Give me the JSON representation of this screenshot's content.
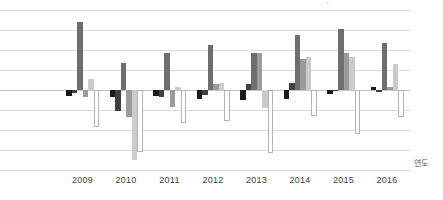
{
  "chart_data": {
    "type": "bar",
    "title": "",
    "xlabel": "연도",
    "ylabel": "",
    "categories": [
      "2009",
      "2010",
      "2011",
      "2012",
      "2013",
      "2014",
      "2015",
      "2016"
    ],
    "series": [
      {
        "name": "series-1-black",
        "color": "#1a1a1a",
        "outlined": false,
        "values": [
          -0.3,
          -0.35,
          -0.3,
          -0.45,
          -0.5,
          -0.45,
          -0.2,
          0.15
        ]
      },
      {
        "name": "series-2-darkest-gray",
        "color": "#3f3f3f",
        "outlined": false,
        "values": [
          -0.15,
          -1.05,
          -0.35,
          -0.25,
          0.3,
          0.35,
          -0.05,
          -0.1
        ]
      },
      {
        "name": "series-3-dark-gray",
        "color": "#6e6e6e",
        "outlined": false,
        "values": [
          3.4,
          1.35,
          1.85,
          2.25,
          1.85,
          2.75,
          3.05,
          2.35
        ]
      },
      {
        "name": "series-4-medium-gray",
        "color": "#9b9b9b",
        "outlined": false,
        "values": [
          -0.35,
          -1.35,
          -0.85,
          0.3,
          1.85,
          1.55,
          1.85,
          0.15
        ]
      },
      {
        "name": "series-5-light-gray",
        "color": "#cbcbcb",
        "outlined": false,
        "values": [
          0.55,
          -3.5,
          0.15,
          0.35,
          -0.9,
          1.65,
          1.65,
          1.3
        ]
      },
      {
        "name": "series-6-white-outline",
        "color": "#ffffff",
        "outlined": true,
        "values": [
          -1.85,
          -3.1,
          -1.65,
          -1.55,
          -3.15,
          -1.3,
          -2.2,
          -1.35
        ]
      }
    ],
    "ylim": [
      -4,
      4
    ],
    "gridline_step": 1,
    "grid": true,
    "legend_position": "none",
    "y_axis_labels_visible": false
  },
  "colors": {
    "gridline": "#dadada",
    "zero_line": "#c6c6c6",
    "tick_label": "#3f3f3f",
    "axis_title": "#555555"
  },
  "artifact_mark": "'"
}
